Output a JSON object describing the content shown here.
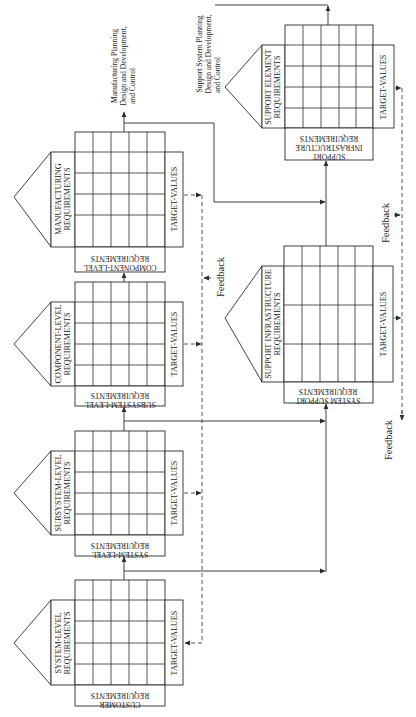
{
  "diagram": {
    "orientation": "rotated 90 degrees counter-clockwise",
    "houses": [
      {
        "id": "manufacturing",
        "roof_label": "MANUFACTURING REQUIREMENTS",
        "target_label": "TARGET-VALUES",
        "base_label_line1": "COMPONENT-LEVEL",
        "base_label_line2": "REQUIREMENTS",
        "grid_rows": 4,
        "grid_cols": 5
      },
      {
        "id": "component",
        "roof_label_line1": "COMPONENT-LEVEL",
        "roof_label_line2": "REQUIREMENTS",
        "target_label": "TARGET-VALUES",
        "base_label_line1": "SUBSYSTEM-LEVEL",
        "base_label_line2": "REQUIREMENTS",
        "grid_rows": 4,
        "grid_cols": 5
      },
      {
        "id": "subsystem",
        "roof_label_line1": "SUBSYSTEM-LEVEL",
        "roof_label_line2": "REQUIREMENTS",
        "target_label": "TARGET-VALUES",
        "base_label_line1": "SYSTEM-LEVEL",
        "base_label_line2": "REQUIREMENTS",
        "grid_rows": 4,
        "grid_cols": 5
      },
      {
        "id": "system",
        "roof_label_line1": "SYSTEM-LEVEL",
        "roof_label_line2": "REQUIREMENTS",
        "target_label": "TARGET-VALUES",
        "base_label_line1": "CUSTOMER",
        "base_label_line2": "REQUIREMENTS",
        "grid_rows": 4,
        "grid_cols": 5
      },
      {
        "id": "support-element",
        "roof_label_line1": "SUPPORT ELEMENT",
        "roof_label_line2": "REQUIREMENTS",
        "target_label": "TARGET-VALUES",
        "base_label_line1": "SUPPORT",
        "base_label_line2": "INFRASTRUCTURE",
        "base_label_line3": "REQUIREMENTS",
        "grid_rows": 4,
        "grid_cols": 5
      },
      {
        "id": "support-infrastructure",
        "roof_label_line1": "SUPPORT INFRASTRUCTURE",
        "roof_label_line2": "REQUIREMENTS",
        "target_label": "TARGET-VALUES",
        "base_label_line1": "SYSTEM SUPPORT",
        "base_label_line2": "REQUIREMENTS",
        "grid_rows": 3,
        "grid_cols": 5
      }
    ],
    "house_labels": {
      "manufacturing_line1": "MANUFACTURING",
      "manufacturing_line2": "REQUIREMENTS"
    },
    "outputs": {
      "manufacturing_line1": "Manufacturing Planning",
      "manufacturing_line2": "Design and Development,",
      "manufacturing_line3": "and Control",
      "support_line1": "Support System Planning",
      "support_line2": "Design and Development,",
      "support_line3": "and Control"
    },
    "feedback_labels": {
      "left": "Feedback",
      "right_upper": "Feedback",
      "right_lower": "Feedback"
    }
  }
}
